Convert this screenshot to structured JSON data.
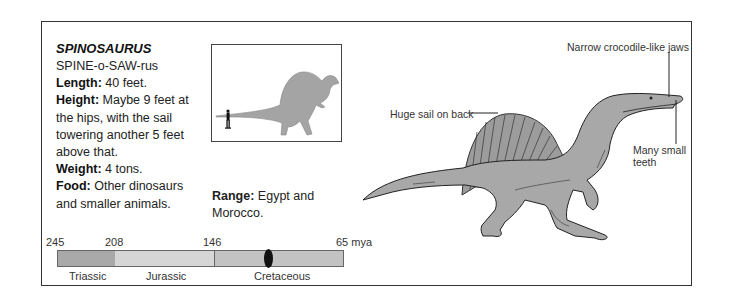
{
  "card": {
    "title": "SPINOSAURUS",
    "pronunciation": "SPINE-o-SAW-rus",
    "facts": [
      {
        "label": "Length:",
        "value": " 40 feet."
      },
      {
        "label": "Height:",
        "value": " Maybe 9 feet at the hips, with the sail towering another 5 feet above that."
      },
      {
        "label": "Weight:",
        "value": " 4 tons."
      },
      {
        "label": "Food:",
        "value": " Other dinosaurs and smaller animals."
      }
    ],
    "range": {
      "label": "Range:",
      "value": " Egypt and Morocco."
    }
  },
  "timeline": {
    "ticks": [
      "245",
      "208",
      "146",
      "65 mya"
    ],
    "periods": [
      "Triassic",
      "Jurassic",
      "Cretaceous"
    ],
    "colors": {
      "triassic": "#a9a9a9",
      "jurassic": "#d6d6d6",
      "cretaceous": "#c2c2c2",
      "marker": "#111111"
    }
  },
  "callouts": {
    "jaws": "Narrow crocodile-like jaws",
    "sail": "Huge sail on back",
    "teeth_line1": "Many small",
    "teeth_line2": "teeth"
  },
  "icons": {
    "scale_figure": "human-silhouette-icon",
    "size_comparison": "dinosaur-silhouette-icon"
  }
}
